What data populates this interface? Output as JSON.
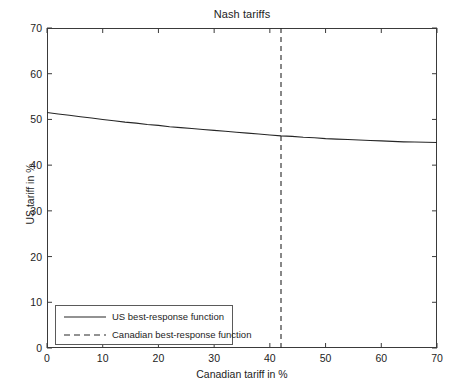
{
  "chart_data": {
    "type": "line",
    "title": "Nash tariffs",
    "xlabel": "Canadian tariff in %",
    "ylabel": "US tariff in %",
    "xlim": [
      0,
      70
    ],
    "ylim": [
      0,
      70
    ],
    "xticks": [
      0,
      10,
      20,
      30,
      40,
      50,
      60,
      70
    ],
    "yticks": [
      0,
      10,
      20,
      30,
      40,
      50,
      60,
      70
    ],
    "grid": false,
    "legend_position": "lower left",
    "series": [
      {
        "name": "US best-response function",
        "style": "solid",
        "color": "#262626",
        "x": [
          0,
          2,
          4,
          6,
          8,
          10,
          12,
          14,
          16,
          18,
          20,
          22,
          24,
          26,
          28,
          30,
          32,
          34,
          36,
          38,
          40,
          42,
          44,
          46,
          48,
          50,
          52,
          54,
          56,
          58,
          60,
          62,
          64,
          66,
          68,
          70
        ],
        "y": [
          51.5,
          51.2,
          50.9,
          50.6,
          50.3,
          50.0,
          49.7,
          49.4,
          49.2,
          48.9,
          48.7,
          48.4,
          48.2,
          48.0,
          47.8,
          47.6,
          47.4,
          47.2,
          47.0,
          46.8,
          46.6,
          46.4,
          46.3,
          46.1,
          46.0,
          45.8,
          45.7,
          45.6,
          45.5,
          45.4,
          45.3,
          45.2,
          45.1,
          45.05,
          45.0,
          44.95
        ]
      },
      {
        "name": "Canadian best-response function",
        "style": "dashed",
        "color": "#262626",
        "vertical_line_x": 42,
        "x": [
          42,
          42
        ],
        "y": [
          0,
          70
        ]
      }
    ],
    "nash_equilibrium": {
      "canadian_tariff": 42,
      "us_tariff": 46.4
    }
  },
  "legend": {
    "items": [
      {
        "label": "US best-response function",
        "style": "solid"
      },
      {
        "label": "Canadian best-response function",
        "style": "dashed"
      }
    ]
  }
}
